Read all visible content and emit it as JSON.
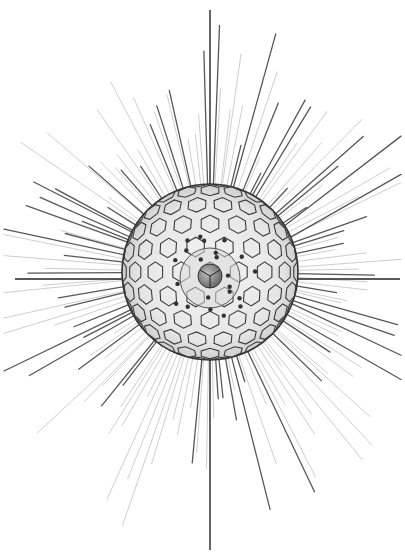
{
  "image": {
    "subject": "radiolarian illustration",
    "background": "#ffffff",
    "ink": "#2a2a2a",
    "width": 405,
    "height": 558
  },
  "figure": {
    "center": [
      210,
      272
    ],
    "sphere_radius": 88,
    "inner_sphere_radius": 30,
    "core_radius": 12,
    "vertical_spine": {
      "x": 210,
      "y1": 10,
      "y2": 550
    },
    "horizontal_spine": {
      "y": 279,
      "x1": 15,
      "x2": 400
    },
    "radial_spine_count": 140,
    "spine_min_length": 40,
    "spine_max_length": 195,
    "hex_cell_size": 11,
    "granule_count": 22
  }
}
